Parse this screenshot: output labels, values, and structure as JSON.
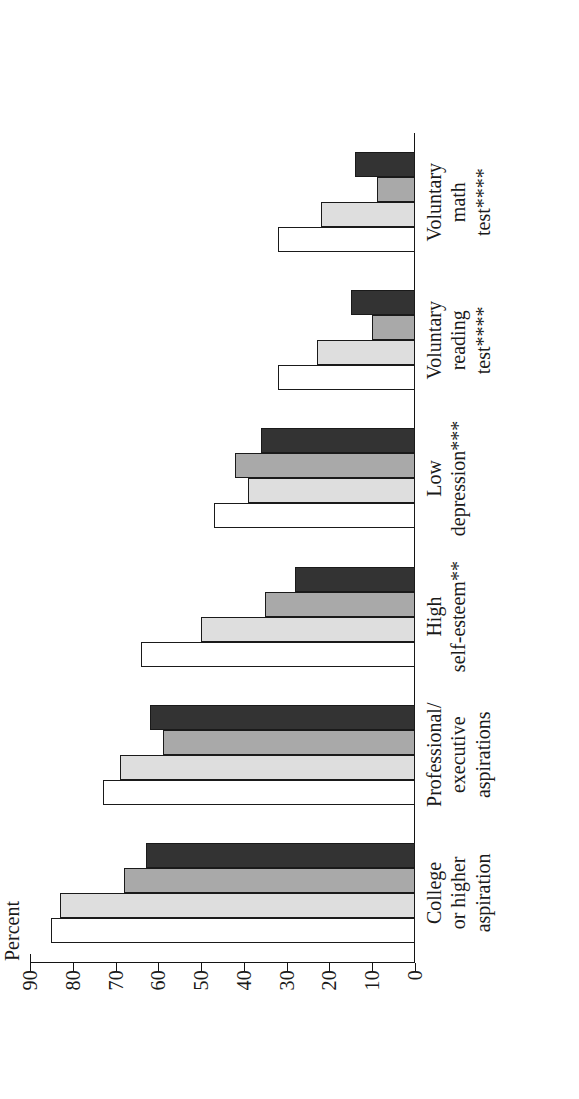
{
  "chart_data": {
    "type": "bar",
    "title": "",
    "xlabel": "",
    "ylabel": "Percent",
    "ylim": [
      0,
      90
    ],
    "ytick_step": 10,
    "grid": false,
    "legend": "none",
    "orientation": "vertical-bars-rotated-90ccw",
    "axis_title": "Percent",
    "tick_labels": [
      "90",
      "80",
      "70",
      "60",
      "50",
      "40",
      "30",
      "20",
      "10",
      "0"
    ],
    "tick_values": [
      90,
      80,
      70,
      60,
      50,
      40,
      30,
      20,
      10,
      0
    ],
    "categories": [
      "College\nor higher\naspiration",
      "Professional/\nexecutive\naspirations",
      "High\nself-esteem**",
      "Low\ndepression***",
      "Voluntary\nreading\ntest****",
      "Voluntary\nmath\ntest****"
    ],
    "series": [
      {
        "name": "series-1",
        "fill": "#ffffff",
        "values": [
          85,
          73,
          64,
          47,
          32,
          32
        ]
      },
      {
        "name": "series-2",
        "fill": "#dedede",
        "values": [
          83,
          69,
          50,
          39,
          23,
          22
        ]
      },
      {
        "name": "series-3",
        "fill": "#a9a9a9",
        "values": [
          68,
          59,
          35,
          42,
          10,
          9
        ]
      },
      {
        "name": "series-4",
        "fill": "#333333",
        "values": [
          63,
          62,
          28,
          36,
          15,
          14
        ]
      }
    ],
    "colors": {
      "axis": "#141414",
      "bar_outline": "#1a1a1a",
      "background": "#ffffff"
    }
  }
}
